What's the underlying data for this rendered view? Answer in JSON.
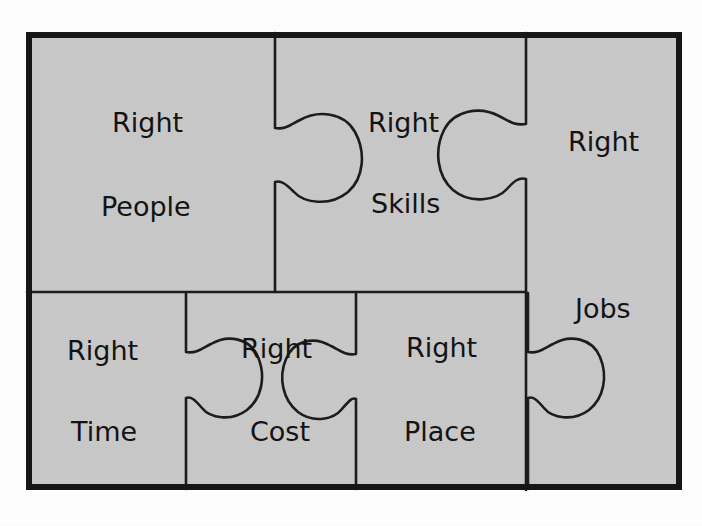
{
  "figure": {
    "background_color": "#ffffff",
    "piece_fill_color": "#c9c9c9",
    "outline_color": "#1a1a1a",
    "frame_color": "#141414"
  },
  "pieces": [
    {
      "id": "right-people",
      "line1": "Right",
      "line2": "People",
      "row": "top",
      "column": "left"
    },
    {
      "id": "right-skills",
      "line1": "Right",
      "line2": "Skills",
      "row": "top",
      "column": "center"
    },
    {
      "id": "right-jobs",
      "line1": "Right",
      "line2": "Jobs",
      "row": "full-height",
      "column": "right"
    },
    {
      "id": "right-time",
      "line1": "Right",
      "line2": "Time",
      "row": "bottom",
      "column": "left"
    },
    {
      "id": "right-cost",
      "line1": "Right",
      "line2": "Cost",
      "row": "bottom",
      "column": "center-left"
    },
    {
      "id": "right-place",
      "line1": "Right",
      "line2": "Place",
      "row": "bottom",
      "column": "center-right"
    }
  ]
}
